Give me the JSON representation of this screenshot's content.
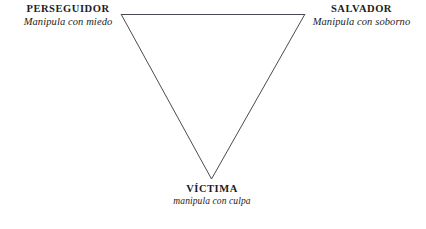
{
  "diagram": {
    "background_color": "#ffffff",
    "line_color": "#4a4a52",
    "text_color": "#1c1c1c",
    "shape": "inverted-triangle",
    "nodes": [
      {
        "id": "perseguidor",
        "title": "PERSEGUIDOR",
        "subtitle": "Manipula con miedo",
        "position": "top-left",
        "vertex": {
          "x": 121,
          "y": 14
        }
      },
      {
        "id": "salvador",
        "title": "SALVADOR",
        "subtitle": "Manipula con soborno",
        "position": "top-right",
        "vertex": {
          "x": 305,
          "y": 14
        }
      },
      {
        "id": "victima",
        "title": "VÍCTIMA",
        "subtitle": "manipula con culpa",
        "position": "bottom",
        "vertex": {
          "x": 211,
          "y": 179
        }
      }
    ],
    "edges": [
      {
        "id": "edge-top",
        "from": "perseguidor",
        "to": "salvador"
      },
      {
        "id": "edge-right",
        "from": "salvador",
        "to": "victima"
      },
      {
        "id": "edge-left",
        "from": "victima",
        "to": "perseguidor"
      }
    ]
  }
}
